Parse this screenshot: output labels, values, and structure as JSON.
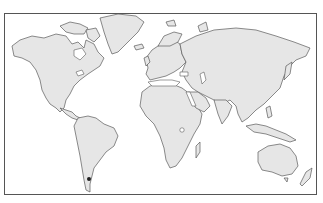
{
  "map": {
    "type": "world-outline",
    "projection": "equirectangular-like",
    "colors": {
      "background": "#ffffff",
      "ocean": "#ffffff",
      "land_fill": "#e6e6e6",
      "coast_stroke": "#5a5a5a",
      "frame_stroke": "#555555",
      "marker": "#222222"
    },
    "marker": {
      "label": "",
      "region": "southern Argentina (Patagonia)",
      "x": 89,
      "y": 179
    }
  }
}
